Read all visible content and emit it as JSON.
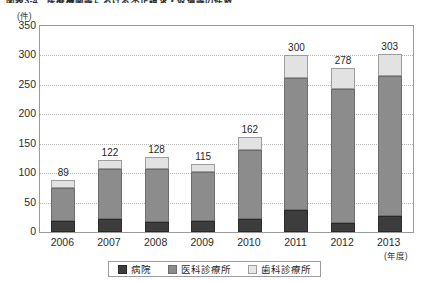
{
  "figure": {
    "title": "図表3-4　医療機関等における不正請求・返還等の件数",
    "y_unit": "(件)",
    "x_unit": "(年度)"
  },
  "legend": {
    "items": [
      {
        "label": "病院",
        "color": "#3d3d3d",
        "icon": "legend-swatch-hospital"
      },
      {
        "label": "医科診療所",
        "color": "#8c8c8c",
        "icon": "legend-swatch-medical"
      },
      {
        "label": "歯科診療所",
        "color": "#e8e8e8",
        "icon": "legend-swatch-dental"
      }
    ]
  },
  "chart_data": {
    "type": "bar",
    "stacked": true,
    "title": "図表3-4　医療機関等における不正請求・返還等の件数",
    "xlabel": "(年度)",
    "ylabel": "(件)",
    "ylim": [
      0,
      350
    ],
    "yticks": [
      0,
      50,
      100,
      150,
      200,
      250,
      300,
      350
    ],
    "grid": true,
    "legend_position": "bottom",
    "categories": [
      "2006",
      "2007",
      "2008",
      "2009",
      "2010",
      "2011",
      "2012",
      "2013"
    ],
    "series": [
      {
        "name": "病院",
        "color": "#3d3d3d",
        "values": [
          18,
          22,
          17,
          19,
          22,
          38,
          15,
          28
        ]
      },
      {
        "name": "医科診療所",
        "color": "#8c8c8c",
        "values": [
          56,
          85,
          90,
          83,
          118,
          224,
          228,
          237
        ]
      },
      {
        "name": "歯科診療所",
        "color": "#e2e2e2",
        "values": [
          15,
          15,
          21,
          13,
          22,
          38,
          35,
          38
        ]
      }
    ],
    "totals": [
      89,
      122,
      128,
      115,
      162,
      300,
      278,
      303
    ],
    "total_labels": [
      "89",
      "122",
      "128",
      "115",
      "162",
      "300",
      "278",
      "303"
    ]
  }
}
